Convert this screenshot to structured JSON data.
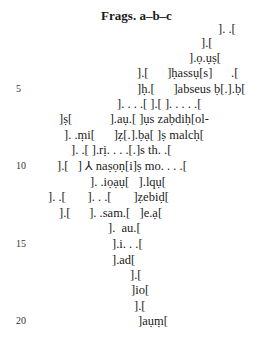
{
  "title": "Frags. a–b–c",
  "lines": [
    {
      "n": 1,
      "text": "]. .[",
      "x": 218,
      "y": 33
    },
    {
      "n": 2,
      "text": "].[",
      "x": 201,
      "y": 47
    },
    {
      "n": 3,
      "text": "].ọ.ụṣ[",
      "x": 189,
      "y": 62
    },
    {
      "n": 4,
      "text": "].[      ]ḥassụ[s]      .[",
      "x": 137,
      "y": 77
    },
    {
      "n": 5,
      "text": "]ḥ.[      ]abseus ḅ[.].ḅ[",
      "x": 137,
      "y": 93
    },
    {
      "n": 6,
      "text": "]. . . .[ ].[ ]. . . . .[",
      "x": 117,
      "y": 108
    },
    {
      "n": 7,
      "text": "]ṣ[            ].aụ.[ ]ụs zaḅdiḥ[ol-",
      "x": 59,
      "y": 123
    },
    {
      "n": 8,
      "text": "]. .ṃi[      ]ẓ[.].ḅạ[ ]ṣ malcḥ[",
      "x": 64,
      "y": 139
    },
    {
      "n": 9,
      "text": "]. .[ ].rị. . . .[.]s th. .[",
      "x": 71,
      "y": 154
    },
    {
      "n": 10,
      "text": "].[   ] ⅄ naṣọṇ[i]ṣ mo. . . .[",
      "x": 57,
      "y": 170
    },
    {
      "n": 11,
      "text": "]. .iọạụ[   ].lqụ[",
      "x": 90,
      "y": 186
    },
    {
      "n": 12,
      "text": "]. .[       ]. . .[       ]ẓebiḍ[",
      "x": 48,
      "y": 201
    },
    {
      "n": 13,
      "text": "].[      ]. .sam.[   ]e.ạ[",
      "x": 59,
      "y": 217
    },
    {
      "n": 14,
      "text": "].  au.[",
      "x": 108,
      "y": 232
    },
    {
      "n": 15,
      "text": "].i. . .[",
      "x": 112,
      "y": 248
    },
    {
      "n": 16,
      "text": "].ad[",
      "x": 112,
      "y": 264
    },
    {
      "n": 17,
      "text": "].[",
      "x": 130,
      "y": 279
    },
    {
      "n": 18,
      "text": "]io[",
      "x": 131,
      "y": 294
    },
    {
      "n": 19,
      "text": "].[",
      "x": 134,
      "y": 310
    },
    {
      "n": 20,
      "text": "]aụṃ[",
      "x": 138,
      "y": 325
    }
  ],
  "line_numbers": [
    {
      "label": "5",
      "y": 93
    },
    {
      "label": "10",
      "y": 170
    },
    {
      "label": "15",
      "y": 248
    },
    {
      "label": "20",
      "y": 325
    }
  ]
}
